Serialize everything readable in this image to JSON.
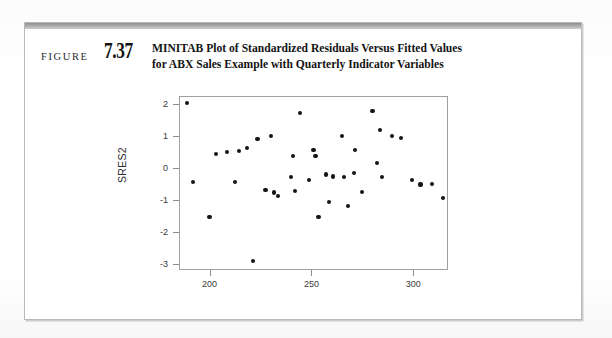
{
  "figure": {
    "label": "FIGURE",
    "number": "7.37",
    "title_line1": "MINITAB Plot of Standardized Residuals Versus Fitted Values",
    "title_line2": "for ABX Sales Example with Quarterly Indicator Variables"
  },
  "colors": {
    "point": "#151515",
    "frame": "#a0a0a0",
    "header_bar": "#a8a8a8",
    "text": "#141414"
  },
  "chart_data": {
    "type": "scatter",
    "title": "",
    "xlabel": "",
    "ylabel": "SRES2",
    "xlim": [
      185,
      317
    ],
    "ylim": [
      -3.2,
      2.25
    ],
    "xticks": [
      200,
      250,
      300
    ],
    "xticklabels": [
      "200",
      "250",
      "300"
    ],
    "yticks": [
      2,
      1,
      0,
      -1,
      -2,
      -3
    ],
    "yticklabels": [
      "2",
      "1",
      "0",
      "-1",
      "-2",
      "-3"
    ],
    "grid": false,
    "legend": false,
    "series": [
      {
        "name": "SRES2",
        "marker": "filled-circle",
        "points": [
          [
            188.5,
            2.05
          ],
          [
            191.5,
            -0.41
          ],
          [
            199.5,
            -1.5
          ],
          [
            202.5,
            0.46
          ],
          [
            208.0,
            0.53
          ],
          [
            212.0,
            -0.41
          ],
          [
            214.0,
            0.57
          ],
          [
            218.0,
            0.66
          ],
          [
            221.0,
            -2.88
          ],
          [
            223.0,
            0.94
          ],
          [
            227.0,
            -0.67
          ],
          [
            229.5,
            1.03
          ],
          [
            231.0,
            -0.74
          ],
          [
            233.0,
            -0.86
          ],
          [
            239.5,
            -0.26
          ],
          [
            240.5,
            0.41
          ],
          [
            241.5,
            -0.7
          ],
          [
            244.0,
            1.74
          ],
          [
            248.5,
            -0.35
          ],
          [
            250.5,
            0.58
          ],
          [
            251.5,
            0.39
          ],
          [
            253.0,
            -1.51
          ],
          [
            256.5,
            -0.18
          ],
          [
            258.0,
            -1.04
          ],
          [
            260.0,
            -0.24
          ],
          [
            264.5,
            1.02
          ],
          [
            265.5,
            -0.25
          ],
          [
            267.5,
            -1.17
          ],
          [
            270.5,
            -0.12
          ],
          [
            271.0,
            0.59
          ],
          [
            274.5,
            -0.72
          ],
          [
            279.5,
            1.8
          ],
          [
            281.5,
            0.19
          ],
          [
            283.0,
            1.22
          ],
          [
            284.0,
            -0.25
          ],
          [
            289.0,
            1.04
          ],
          [
            293.5,
            0.97
          ],
          [
            299.0,
            -0.34
          ],
          [
            303.0,
            -0.49
          ],
          [
            308.5,
            -0.47
          ],
          [
            314.0,
            -0.92
          ]
        ]
      }
    ]
  }
}
